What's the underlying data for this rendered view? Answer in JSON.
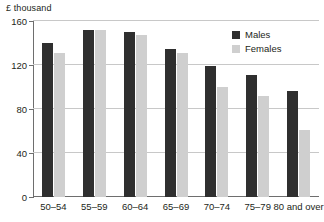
{
  "chart_data": {
    "type": "bar",
    "title": "",
    "subtitle": "",
    "unit_label": "£ thousand",
    "xlabel": "",
    "ylabel": "",
    "ylim": [
      0,
      160
    ],
    "yticks": [
      0,
      40,
      80,
      120,
      160
    ],
    "ytick_labels": [
      "0",
      "40",
      "80",
      "120",
      "160"
    ],
    "grid": true,
    "legend_position": "top-right",
    "categories": [
      "50–54",
      "55–59",
      "60–64",
      "65–69",
      "70–74",
      "75–79",
      "80 and over"
    ],
    "series": [
      {
        "name": "Males",
        "color": "#2f2f2f",
        "values": [
          140,
          152,
          150,
          135,
          119,
          111,
          96
        ]
      },
      {
        "name": "Females",
        "color": "#cfcfcf",
        "values": [
          131,
          152,
          147,
          131,
          100,
          92,
          61
        ]
      }
    ]
  }
}
